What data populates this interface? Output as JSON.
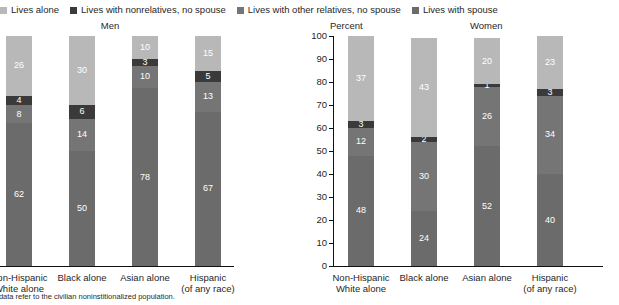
{
  "legend": {
    "items": [
      {
        "label": "Lives alone",
        "color": "#b8b8b8",
        "key": "alone"
      },
      {
        "label": "Lives with nonrelatives, no spouse",
        "color": "#3a3a3a",
        "key": "nonrel"
      },
      {
        "label": "Lives with other relatives, no spouse",
        "color": "#757575",
        "key": "otherrel"
      },
      {
        "label": "Lives with spouse",
        "color": "#6b6b6b",
        "key": "spouse"
      }
    ]
  },
  "headers": {
    "men": "Men",
    "percent": "Percent",
    "women": "Women"
  },
  "footnote": "lation: These data refer to the civilian noninstitionalized population.",
  "axis": {
    "ticks": [
      "0",
      "10",
      "20",
      "30",
      "40",
      "50",
      "60",
      "70",
      "80",
      "90",
      "100"
    ],
    "min": 0,
    "max": 100
  },
  "chart_data": [
    {
      "type": "bar",
      "title": "Men",
      "subtype": "stacked-100",
      "xlabel": "",
      "ylabel": "Percent",
      "ylim": [
        0,
        100
      ],
      "grid": false,
      "legend_position": "top",
      "categories": [
        "Non-Hispanic White alone",
        "Black alone",
        "Asian alone",
        "Hispanic (of any race)"
      ],
      "category_lines": [
        [
          "Non-Hispanic",
          "White alone"
        ],
        [
          "Black alone"
        ],
        [
          "Asian alone"
        ],
        [
          "Hispanic",
          "(of any race)"
        ]
      ],
      "series": [
        {
          "name": "Lives with spouse",
          "color": "#6b6b6b",
          "values": [
            62,
            50,
            78,
            67
          ]
        },
        {
          "name": "Lives with other relatives, no spouse",
          "color": "#757575",
          "values": [
            8,
            14,
            10,
            13
          ]
        },
        {
          "name": "Lives with nonrelatives, no spouse",
          "color": "#3a3a3a",
          "values": [
            4,
            6,
            3,
            5
          ]
        },
        {
          "name": "Lives alone",
          "color": "#b8b8b8",
          "values": [
            26,
            30,
            10,
            15
          ]
        }
      ]
    },
    {
      "type": "bar",
      "title": "Women",
      "subtype": "stacked-100",
      "xlabel": "",
      "ylabel": "Percent",
      "ylim": [
        0,
        100
      ],
      "grid": false,
      "legend_position": "top",
      "categories": [
        "Non-Hispanic White alone",
        "Black alone",
        "Asian alone",
        "Hispanic (of any race)"
      ],
      "category_lines": [
        [
          "Non-Hispanic",
          "White alone"
        ],
        [
          "Black alone"
        ],
        [
          "Asian alone"
        ],
        [
          "Hispanic",
          "(of any race)"
        ]
      ],
      "series": [
        {
          "name": "Lives with spouse",
          "color": "#6b6b6b",
          "values": [
            48,
            24,
            52,
            40
          ]
        },
        {
          "name": "Lives with other relatives, no spouse",
          "color": "#757575",
          "values": [
            12,
            30,
            26,
            34
          ]
        },
        {
          "name": "Lives with nonrelatives, no spouse",
          "color": "#3a3a3a",
          "values": [
            3,
            2,
            1,
            3
          ]
        },
        {
          "name": "Lives alone",
          "color": "#b8b8b8",
          "values": [
            37,
            43,
            20,
            23
          ]
        }
      ]
    }
  ]
}
